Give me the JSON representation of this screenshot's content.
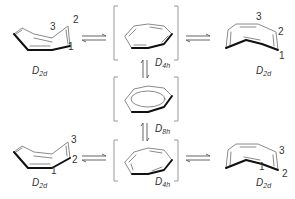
{
  "colors": {
    "line": "#8a8a8a",
    "bold_edge": "#111111",
    "bracket": "#999999",
    "text": "#333333"
  },
  "structures": [
    {
      "id": "top-left",
      "symmetry": {
        "main": "D",
        "sub": "2d"
      },
      "atom_labels": [
        "3",
        "2",
        "1"
      ]
    },
    {
      "id": "top-center",
      "symmetry": {
        "main": "D",
        "sub": "4h"
      },
      "bracketed": true
    },
    {
      "id": "right-top",
      "symmetry": {
        "main": "D",
        "sub": "2d"
      },
      "atom_labels": [
        "3",
        "2",
        "1"
      ]
    },
    {
      "id": "middle-center",
      "symmetry": {
        "main": "D",
        "sub": "8h"
      },
      "bracketed": true
    },
    {
      "id": "bottom-left",
      "symmetry": {
        "main": "D",
        "sub": "2d"
      },
      "atom_labels": [
        "3",
        "2",
        "1"
      ]
    },
    {
      "id": "bottom-center",
      "symmetry": {
        "main": "D",
        "sub": "4h"
      },
      "bracketed": true
    },
    {
      "id": "bottom-right",
      "symmetry": {
        "main": "D",
        "sub": "2d"
      },
      "atom_labels": [
        "3",
        "2",
        "1"
      ]
    }
  ],
  "arrows": [
    {
      "from": "top-left",
      "to": "top-center",
      "type": "equilibrium"
    },
    {
      "from": "top-center",
      "to": "right-top",
      "type": "equilibrium"
    },
    {
      "from": "top-center",
      "to": "middle-center",
      "type": "equilibrium-vertical"
    },
    {
      "from": "middle-center",
      "to": "bottom-center",
      "type": "equilibrium-vertical"
    },
    {
      "from": "bottom-left",
      "to": "bottom-center",
      "type": "equilibrium"
    },
    {
      "from": "bottom-center",
      "to": "bottom-right",
      "type": "equilibrium"
    }
  ]
}
